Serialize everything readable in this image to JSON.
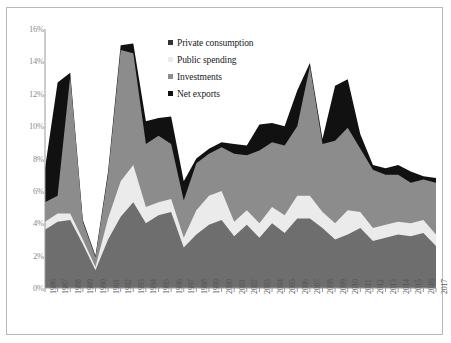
{
  "chart_data": {
    "type": "area",
    "stacked": true,
    "title": "",
    "subtitle": "",
    "xlabel": "",
    "ylabel": "",
    "grid": false,
    "legend_position": "inside-top-center",
    "ylim": [
      0,
      16
    ],
    "ytick_step": 2,
    "ytick_labels": [
      "0%",
      "2%",
      "4%",
      "6%",
      "8%",
      "10%",
      "12%",
      "14%",
      "16%"
    ],
    "ytick_values": [
      0,
      2,
      4,
      6,
      8,
      10,
      12,
      14,
      16
    ],
    "categories": [
      "1986",
      "1987",
      "1988",
      "1989",
      "1990",
      "1991",
      "1992",
      "1993",
      "1994",
      "1995",
      "1996",
      "1997",
      "1998",
      "1999",
      "2000",
      "2001",
      "2002",
      "2003",
      "2004",
      "2005",
      "2006",
      "2007",
      "2008",
      "2009",
      "2010",
      "2011",
      "2012",
      "2013",
      "2014",
      "2015",
      "2016",
      "2017"
    ],
    "series": [
      {
        "name": "Private consumption",
        "color": "#6e6e6e",
        "values": [
          3.6,
          4.1,
          4.2,
          2.7,
          1.1,
          3.0,
          4.4,
          5.3,
          4.0,
          4.5,
          4.7,
          2.5,
          3.3,
          3.9,
          4.2,
          3.2,
          3.9,
          3.1,
          4.0,
          3.4,
          4.3,
          4.3,
          3.7,
          3.0,
          3.3,
          3.7,
          2.9,
          3.1,
          3.3,
          3.2,
          3.4,
          2.6
        ]
      },
      {
        "name": "Public spending",
        "color": "#ebebeb",
        "values": [
          0.5,
          0.5,
          0.4,
          0.3,
          0.2,
          1.3,
          2.2,
          2.3,
          1.0,
          0.8,
          0.8,
          0.6,
          1.5,
          1.8,
          1.8,
          0.9,
          0.9,
          0.9,
          1.0,
          1.1,
          1.4,
          1.4,
          1.0,
          1.0,
          1.5,
          1.0,
          0.8,
          0.8,
          0.8,
          0.8,
          0.8,
          0.7
        ]
      },
      {
        "name": "Investments",
        "color": "#8c8c8c",
        "values": [
          1.2,
          1.1,
          8.5,
          1.1,
          0.6,
          2.7,
          8.1,
          6.9,
          3.9,
          4.1,
          3.4,
          2.3,
          2.9,
          2.6,
          2.7,
          4.2,
          3.4,
          4.5,
          4.0,
          4.3,
          4.3,
          8.0,
          4.2,
          5.1,
          5.1,
          3.9,
          3.6,
          3.1,
          2.9,
          2.5,
          2.5,
          3.2
        ]
      },
      {
        "name": "Net exports",
        "color": "#111111",
        "values": [
          2.1,
          7.0,
          0.2,
          0.1,
          0.1,
          0.2,
          0.3,
          0.6,
          1.4,
          1.1,
          1.7,
          1.2,
          0.3,
          0.3,
          0.3,
          0.6,
          0.6,
          1.6,
          1.2,
          1.2,
          2.2,
          0.2,
          0.3,
          3.4,
          3.0,
          0.9,
          0.3,
          0.4,
          0.6,
          0.7,
          0.2,
          0.3
        ]
      }
    ]
  },
  "legend": {
    "items": [
      {
        "label": "Private consumption",
        "color": "#333333"
      },
      {
        "label": "Public spending",
        "color": "#ebebeb"
      },
      {
        "label": "Investments",
        "color": "#8c8c8c"
      },
      {
        "label": "Net exports",
        "color": "#111111"
      }
    ]
  }
}
